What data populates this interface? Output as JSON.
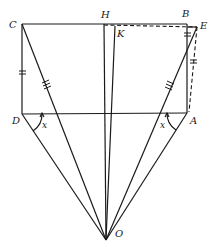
{
  "diagram": {
    "points": {
      "C": {
        "label": "C",
        "x": 22,
        "y": 24
      },
      "B": {
        "label": "B",
        "x": 187,
        "y": 24
      },
      "E": {
        "label": "E",
        "x": 197,
        "y": 27
      },
      "H": {
        "label": "H",
        "x": 104,
        "y": 24
      },
      "K": {
        "label": "K",
        "x": 115,
        "y": 26
      },
      "D": {
        "label": "D",
        "x": 22,
        "y": 114
      },
      "A": {
        "label": "A",
        "x": 187,
        "y": 113
      },
      "O": {
        "label": "O",
        "x": 106,
        "y": 240
      }
    },
    "angles": [
      {
        "label": "x",
        "vertex": "D"
      },
      {
        "label": "x",
        "vertex": "A"
      }
    ],
    "segments_solid": [
      "CB",
      "CD",
      "DA",
      "BA",
      "AE",
      "CO",
      "DO",
      "HO",
      "KO",
      "EO",
      "AO"
    ],
    "segments_dashed": [
      "CE",
      "BE"
    ],
    "equal_marks": [
      {
        "segments": [
          "CD",
          "BE"
        ],
        "ticks": 2
      },
      {
        "segments": [
          "CO",
          "EO"
        ],
        "ticks": 3
      }
    ]
  }
}
